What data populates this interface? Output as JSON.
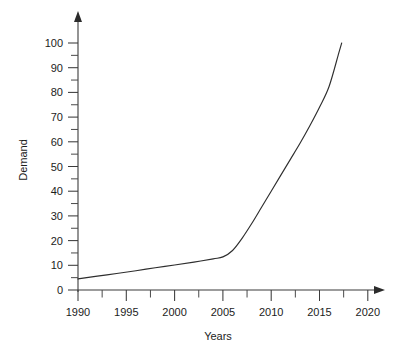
{
  "chart_data": {
    "type": "line",
    "title": "",
    "xlabel": "Years",
    "ylabel": "Demand",
    "xlim": [
      1990,
      2021.5
    ],
    "ylim": [
      0,
      104
    ],
    "grid": false,
    "legend": null,
    "x_ticks": [
      1990,
      1995,
      2000,
      2005,
      2010,
      2015,
      2020
    ],
    "x_tick_labels": [
      "1990",
      "1995",
      "2000",
      "2005",
      "2010",
      "2015",
      "2020"
    ],
    "x_minor_ticks": [
      1992.5,
      1997.5,
      2002.5,
      2007.5,
      2012.5,
      2017.5
    ],
    "y_ticks": [
      0,
      10,
      20,
      30,
      40,
      50,
      60,
      70,
      80,
      90,
      100
    ],
    "y_tick_labels": [
      "0",
      "10",
      "20",
      "30",
      "40",
      "50",
      "60",
      "70",
      "80",
      "90",
      "100"
    ],
    "y_minor_ticks": [
      5,
      15,
      25,
      35,
      45,
      55,
      65,
      75,
      85,
      95
    ],
    "series": [
      {
        "name": "Demand",
        "color": "#2e2e2e",
        "x": [
          1990,
          1992,
          1994,
          1996,
          1998,
          2000,
          2002,
          2004,
          2005,
          2006,
          2007,
          2008,
          2009,
          2010,
          2011,
          2012,
          2013,
          2014,
          2015,
          2016,
          2017,
          2017.3
        ],
        "values": [
          4.5,
          5.6,
          6.7,
          7.8,
          9.0,
          10.1,
          11.3,
          12.6,
          13.4,
          16.0,
          21.0,
          27.0,
          33.5,
          40.0,
          46.5,
          53.0,
          59.5,
          66.5,
          74.0,
          82.5,
          96.0,
          100.0
        ]
      }
    ]
  },
  "axis_labels": {
    "y_axis_title": "Demand",
    "x_axis_title": "Years"
  },
  "ticks": {
    "y": [
      "100",
      "90",
      "80",
      "70",
      "60",
      "50",
      "40",
      "30",
      "20",
      "10",
      "0"
    ],
    "x": [
      "1990",
      "1995",
      "2000",
      "2005",
      "2010",
      "2015",
      "2020"
    ]
  },
  "colors": {
    "background": "#ffffff",
    "axis": "#3b3b3b",
    "curve": "#2e2e2e",
    "text": "#1c1c1c"
  }
}
